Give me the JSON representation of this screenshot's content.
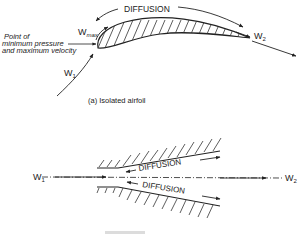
{
  "figure_a": {
    "diffusion_label": "DIFFUSION",
    "w_max": "W",
    "w_max_sub": "max",
    "w1": "W",
    "w1_sub": "1",
    "w2": "W",
    "w2_sub": "2",
    "annotation_line1": "Point of",
    "annotation_line2": "minimum pressure",
    "annotation_line3": "and maximum velocity",
    "caption": "(a) Isolated airfoil"
  },
  "figure_b": {
    "upper_diffusion_label": "DIFFUSION",
    "lower_diffusion_label": "DIFFUSION",
    "w1": "W",
    "w1_sub": "1",
    "w2": "W",
    "w2_sub": "2"
  },
  "colors": {
    "ink": "#222222",
    "background": "#ffffff"
  }
}
